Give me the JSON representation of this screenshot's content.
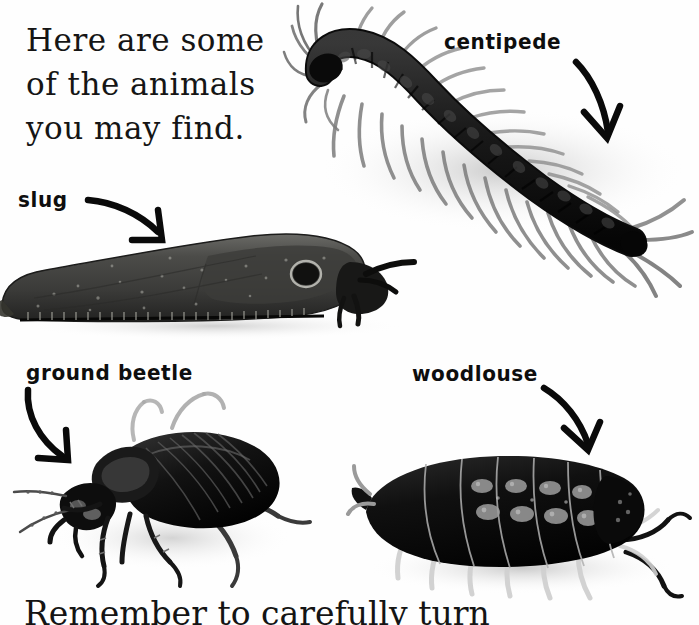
{
  "page": {
    "background_color": "#ffffff",
    "ink_color": "#111111",
    "width": 699,
    "height": 625
  },
  "intro": {
    "lines": [
      "Here are some",
      "of the animals",
      "you may find."
    ]
  },
  "footer": {
    "text": "Remember to carefully turn",
    "note_clipped": "bottom of line cut off by page edge"
  },
  "labels": [
    {
      "id": "centipede",
      "text": "centipede",
      "arrow": "curved-arrow-down-right"
    },
    {
      "id": "slug",
      "text": "slug",
      "arrow": "curved-arrow-down-right"
    },
    {
      "id": "ground-beetle",
      "text": "ground beetle",
      "arrow": "curved-arrow-down-right"
    },
    {
      "id": "woodlouse",
      "text": "woodlouse",
      "arrow": "curved-arrow-down-right"
    }
  ],
  "photos": [
    {
      "id": "centipede",
      "alt": "centipede-photo",
      "style": "black and white photograph"
    },
    {
      "id": "slug",
      "alt": "slug-photo",
      "style": "black and white photograph"
    },
    {
      "id": "ground-beetle",
      "alt": "ground-beetle-photo",
      "style": "black and white photograph"
    },
    {
      "id": "woodlouse",
      "alt": "woodlouse-photo",
      "style": "black and white photograph"
    }
  ]
}
